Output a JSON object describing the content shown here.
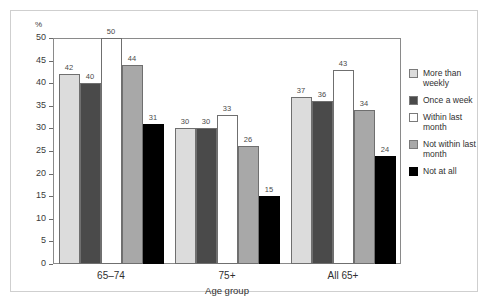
{
  "chart_data": {
    "type": "bar",
    "title": "",
    "xlabel": "Age group",
    "ylabel": "%",
    "ylim": [
      0,
      50
    ],
    "yticks": [
      0,
      5,
      10,
      15,
      20,
      25,
      30,
      35,
      40,
      45,
      50
    ],
    "grid": true,
    "legend_position": "right",
    "categories": [
      "65–74",
      "75+",
      "All 65+"
    ],
    "series": [
      {
        "name": "More than weekly",
        "values": [
          42,
          30,
          37
        ],
        "color": "#dcdcdc"
      },
      {
        "name": "Once a week",
        "values": [
          40,
          30,
          36
        ],
        "color": "#4a4a4a"
      },
      {
        "name": "Within last month",
        "values": [
          50,
          33,
          43
        ],
        "color": "#ffffff"
      },
      {
        "name": "Not within last month",
        "values": [
          44,
          26,
          34
        ],
        "color": "#a8a8a8"
      },
      {
        "name": "Not at all",
        "values": [
          31,
          15,
          24
        ],
        "color": "#000000"
      }
    ]
  },
  "legend": {
    "items": [
      {
        "label": "More than weekly"
      },
      {
        "label": "Once a week"
      },
      {
        "label": "Within last month"
      },
      {
        "label": "Not within last month"
      },
      {
        "label": "Not at all"
      }
    ]
  }
}
